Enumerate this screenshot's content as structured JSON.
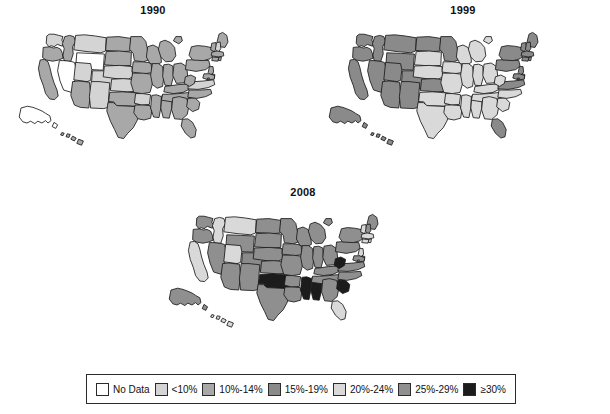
{
  "figure": {
    "type": "choropleth-map-series",
    "panels": [
      {
        "id": "1990",
        "title": "1990"
      },
      {
        "id": "1999",
        "title": "1999"
      },
      {
        "id": "2008",
        "title": "2008"
      }
    ]
  },
  "legend": {
    "entries": [
      {
        "label": "No Data",
        "color": "#ffffff"
      },
      {
        "label": "<10%",
        "color": "#d4d4d4"
      },
      {
        "label": "10%-14%",
        "color": "#a8a8a8"
      },
      {
        "label": "15%-19%",
        "color": "#8a8a8a"
      },
      {
        "label": "20%-24%",
        "color": "#d9d9d9"
      },
      {
        "label": "25%-29%",
        "color": "#8f8f8f"
      },
      {
        "label": "≥30%",
        "color": "#1c1c1c"
      }
    ]
  },
  "chart_data": {
    "type": "heatmap",
    "xlabel": "",
    "ylabel": "",
    "legend_position": "bottom",
    "grid": false,
    "categories": [
      "No Data",
      "<10%",
      "10%-14%",
      "15%-19%",
      "20%-24%",
      "25%-29%",
      "≥30%"
    ],
    "category_colors": [
      "#ffffff",
      "#d4d4d4",
      "#a8a8a8",
      "#8a8a8a",
      "#d9d9d9",
      "#8f8f8f",
      "#1c1c1c"
    ],
    "series": [
      {
        "name": "1990",
        "values": {
          "AK": "No Data",
          "AL": "10%-14%",
          "AR": "<10%",
          "AZ": "10%-14%",
          "CA": "10%-14%",
          "CO": "<10%",
          "CT": "10%-14%",
          "DC": "10%-14%",
          "DE": "10%-14%",
          "FL": "10%-14%",
          "GA": "10%-14%",
          "HI": "10%-14%",
          "IA": "10%-14%",
          "ID": "10%-14%",
          "IL": "10%-14%",
          "IN": "10%-14%",
          "KS": "<10%",
          "KY": "10%-14%",
          "LA": "10%-14%",
          "MA": "10%-14%",
          "MD": "10%-14%",
          "ME": "10%-14%",
          "MI": "10%-14%",
          "MN": "10%-14%",
          "MO": "10%-14%",
          "MS": "10%-14%",
          "MT": "<10%",
          "NC": "10%-14%",
          "ND": "10%-14%",
          "NE": "<10%",
          "NH": "<10%",
          "NJ": "10%-14%",
          "NM": "<10%",
          "NV": "No Data",
          "NY": "10%-14%",
          "OH": "10%-14%",
          "OK": "10%-14%",
          "OR": "10%-14%",
          "PA": "10%-14%",
          "RI": "10%-14%",
          "SC": "10%-14%",
          "SD": "10%-14%",
          "TN": "10%-14%",
          "TX": "10%-14%",
          "UT": "<10%",
          "VA": "<10%",
          "VT": "10%-14%",
          "WA": "<10%",
          "WI": "10%-14%",
          "WV": "10%-14%",
          "WY": "No Data"
        }
      },
      {
        "name": "1999",
        "values": {
          "AK": "15%-19%",
          "AL": "20%-24%",
          "AR": "20%-24%",
          "AZ": "15%-19%",
          "CA": "15%-19%",
          "CO": "15%-19%",
          "CT": "15%-19%",
          "DC": "15%-19%",
          "DE": "15%-19%",
          "FL": "15%-19%",
          "GA": "20%-24%",
          "HI": "15%-19%",
          "IA": "20%-24%",
          "ID": "15%-19%",
          "IL": "20%-24%",
          "IN": "20%-24%",
          "KS": "15%-19%",
          "KY": "20%-24%",
          "LA": "20%-24%",
          "MA": "15%-19%",
          "MD": "15%-19%",
          "ME": "15%-19%",
          "MI": "20%-24%",
          "MN": "15%-19%",
          "MO": "20%-24%",
          "MS": "20%-24%",
          "MT": "15%-19%",
          "NC": "20%-24%",
          "ND": "15%-19%",
          "NE": "20%-24%",
          "NH": "15%-19%",
          "NJ": "15%-19%",
          "NM": "15%-19%",
          "NV": "15%-19%",
          "NY": "15%-19%",
          "OH": "20%-24%",
          "OK": "20%-24%",
          "OR": "15%-19%",
          "PA": "15%-19%",
          "RI": "15%-19%",
          "SC": "20%-24%",
          "SD": "20%-24%",
          "TN": "20%-24%",
          "TX": "20%-24%",
          "UT": "15%-19%",
          "VA": "15%-19%",
          "VT": "15%-19%",
          "WA": "15%-19%",
          "WI": "20%-24%",
          "WV": "20%-24%",
          "WY": "15%-19%"
        }
      },
      {
        "name": "2008",
        "values": {
          "AK": "25%-29%",
          "AL": "≥30%",
          "AR": "25%-29%",
          "AZ": "25%-29%",
          "CA": "20%-24%",
          "CO": "15%-19%",
          "CT": "20%-24%",
          "DC": "20%-24%",
          "DE": "25%-29%",
          "FL": "20%-24%",
          "GA": "25%-29%",
          "HI": "20%-24%",
          "IA": "25%-29%",
          "ID": "20%-24%",
          "IL": "25%-29%",
          "IN": "25%-29%",
          "KS": "25%-29%",
          "KY": "25%-29%",
          "LA": "25%-29%",
          "MA": "20%-24%",
          "MD": "25%-29%",
          "ME": "25%-29%",
          "MI": "25%-29%",
          "MN": "25%-29%",
          "MO": "25%-29%",
          "MS": "≥30%",
          "MT": "20%-24%",
          "NC": "25%-29%",
          "ND": "25%-29%",
          "NE": "25%-29%",
          "NH": "25%-29%",
          "NJ": "20%-24%",
          "NM": "25%-29%",
          "NV": "25%-29%",
          "NY": "25%-29%",
          "OH": "25%-29%",
          "OK": "≥30%",
          "OR": "25%-29%",
          "PA": "25%-29%",
          "RI": "20%-24%",
          "SC": "≥30%",
          "SD": "25%-29%",
          "TN": "25%-29%",
          "TX": "25%-29%",
          "UT": "20%-24%",
          "VA": "25%-29%",
          "VT": "20%-24%",
          "WA": "25%-29%",
          "WI": "25%-29%",
          "WV": "≥30%",
          "WY": "25%-29%"
        }
      }
    ]
  },
  "geometry": {
    "viewbox": "0 0 960 540",
    "states": {
      "WA": "M126,60 L124,84 L133,96 L141,92 L150,96 L161,88 L178,94 L183,84 L176,74 L180,62 L166,58 L150,54 L134,54 Z",
      "OR": "M114,98 L112,132 L124,140 L146,144 L166,140 L180,134 L178,118 L172,104 L160,98 L148,100 L136,96 Z",
      "CA": "M104,140 L98,168 L104,198 L114,224 L122,252 L136,270 L152,272 L164,260 L160,240 L150,216 L142,190 L136,164 L130,146 L118,138 Z",
      "NV": "M168,142 L162,176 L170,210 L182,240 L208,248 L220,206 L226,172 L218,148 L196,142 Z",
      "ID": "M186,62 L178,86 L184,102 L180,124 L184,142 L206,144 L214,120 L212,96 L222,78 L216,62 L202,58 Z",
      "MT": "M222,58 L216,106 L260,112 L306,116 L322,110 L324,66 L288,60 L252,56 Z",
      "WY": "M226,116 L222,168 L276,172 L314,174 L318,120 L272,118 Z",
      "UT": "M222,148 L216,206 L260,212 L272,208 L276,172 L272,152 Z",
      "CO": "M278,176 L274,230 L336,236 L354,232 L356,180 L316,176 Z",
      "AZ": "M212,212 L206,258 L218,290 L238,298 L266,300 L272,248 L268,214 L232,210 Z",
      "NM": "M274,212 L268,262 L272,300 L316,302 L330,298 L334,240 L336,216 L300,212 Z",
      "ND": "M326,64 L322,108 L378,112 L404,110 L406,68 L366,62 Z",
      "SD": "M324,112 L318,156 L374,160 L406,158 L408,114 L368,110 Z",
      "NE": "M318,160 L314,196 L356,202 L398,204 L412,196 L410,162 L368,158 Z",
      "KS": "M342,204 L338,242 L394,246 L428,244 L426,206 L382,202 Z",
      "OK": "M336,248 L332,278 L350,280 L356,292 L418,294 L432,290 L430,250 L378,246 Z",
      "TX": "M330,282 L326,310 L338,344 L352,372 L364,398 L382,402 L396,384 L414,366 L426,344 L436,318 L434,296 L400,294 L360,292 L348,282 Z",
      "MN": "M406,62 L402,104 L414,118 L418,142 L448,146 L464,140 L462,106 L456,78 L442,62 Z",
      "IA": "M414,146 L410,180 L450,186 L476,182 L474,150 L446,146 Z",
      "MO": "M412,184 L406,216 L416,248 L444,252 L470,248 L478,220 L480,188 L448,184 Z",
      "AR": "M422,252 L418,284 L442,290 L468,288 L472,256 L446,252 Z",
      "LA": "M420,290 L416,316 L430,336 L450,340 L472,334 L476,310 L470,292 L444,290 Z",
      "WI": "M462,96 L458,130 L470,152 L492,156 L508,148 L506,118 L496,98 L480,90 Z",
      "IL": "M478,152 L472,190 L478,222 L494,234 L512,228 L516,196 L512,162 L498,152 Z",
      "MS": "M476,258 L472,300 L482,330 L500,332 L506,300 L508,262 L492,256 Z",
      "AL": "M510,258 L506,300 L514,332 L534,334 L542,302 L544,264 L528,256 Z",
      "MI": "M504,80 L498,104 L506,130 L522,146 L544,144 L556,126 L552,98 L538,82 L520,74 Z M556,62 L548,76 L566,86 L578,76 L574,62 Z",
      "IN": "M516,156 L512,194 L520,224 L540,226 L548,196 L546,160 L532,154 Z",
      "OH": "M550,154 L546,192 L558,218 L584,216 L596,196 L592,162 L574,150 Z",
      "KY": "M520,228 L516,246 L548,252 L580,248 L600,238 L596,220 L564,222 L538,226 Z",
      "TN": "M512,254 L508,274 L548,280 L584,276 L608,266 L604,248 L566,252 L534,254 Z",
      "GA": "M546,266 L542,306 L552,336 L576,338 L594,322 L600,292 L592,268 L568,262 Z",
      "FL": "M578,338 L574,360 L588,384 L606,400 L620,396 L624,372 L612,348 L596,336 Z",
      "SC": "M596,268 L592,296 L612,312 L632,304 L636,282 L620,266 Z",
      "NC": "M600,240 L596,264 L626,268 L656,262 L676,252 L672,238 L640,240 Z",
      "VA": "M600,214 L596,236 L630,238 L664,232 L686,222 L682,206 L648,210 L620,212 Z",
      "WV": "M588,196 L584,218 L602,228 L618,218 L622,198 L606,190 Z",
      "PA": "M592,140 L588,172 L624,178 L656,172 L670,160 L666,142 L630,138 Z",
      "NY": "M608,96 L600,124 L612,140 L648,142 L670,136 L686,120 L682,100 L652,94 L628,92 Z",
      "ME": "M700,54 L694,78 L704,96 L720,98 L730,80 L726,58 L712,48 Z",
      "VT": "M676,84 L672,106 L684,112 L692,102 L690,82 Z",
      "NH": "M692,82 L688,104 L698,114 L706,102 L704,80 Z",
      "MA": "M676,114 L674,126 L700,130 L716,126 L714,114 L694,110 Z",
      "CT": "M678,130 L676,142 L696,144 L700,132 Z",
      "RI": "M700,130 L698,142 L706,142 L708,130 Z",
      "NJ": "M668,162 L664,182 L674,192 L682,180 L680,162 Z",
      "DE": "M676,186 L674,200 L684,202 L686,188 Z",
      "MD": "M650,186 L646,200 L664,206 L684,204 L686,192 L668,186 Z",
      "DC": "M662,200 L660,206 L666,206 L668,200 Z",
      "AK": "M40,300 L34,330 L46,346 L60,350 L72,344 L86,352 L96,344 L110,350 L122,342 L130,350 L140,342 L136,326 L122,318 L110,310 L96,304 L80,298 L62,294 Z M150,348 L144,362 L156,368 L162,356 Z",
      "HI": "M176,382 L172,390 L180,392 L184,384 Z M194,386 L190,396 L200,398 L204,388 Z M212,394 L206,404 L218,410 L224,400 Z M232,404 L226,418 L242,424 L248,410 Z"
    }
  }
}
